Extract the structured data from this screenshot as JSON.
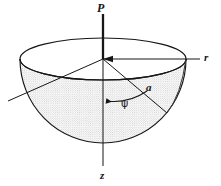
{
  "figure": {
    "background_color": "#ffffff",
    "ink_color": "#161616",
    "stipple_color": "#9a9a9a",
    "labels": {
      "load": "P",
      "radial_axis": "r",
      "vertical_axis": "z",
      "radius": "a",
      "angle": "ψ"
    },
    "geometry": {
      "center_x": 103,
      "center_y": 59,
      "rim_radius_x": 83,
      "rim_radius_y": 21,
      "bowl_depth_y": 84,
      "r_axis_end_x": 200,
      "z_axis_end_y": 166,
      "arrow_start_y": 14,
      "radius_line_end_x": 167,
      "radius_line_end_y": 113,
      "diagonal_end_x": 8,
      "diagonal_end_y": 101
    }
  }
}
